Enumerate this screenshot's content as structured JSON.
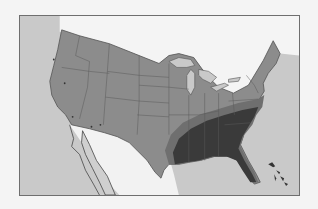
{
  "map": {
    "title": "",
    "region": "United States (contiguous)",
    "projection_style": "grayscale choropleth",
    "colors": {
      "page_background": "#f4f4f4",
      "ocean": "#c9c9c9",
      "foreign_land": "#f2f2f2",
      "us_land": "#8c8c8c",
      "transition_zone": "#6f6f6f",
      "core_range": "#3a3a3a",
      "lakes": "#c9c9c9",
      "borders": "#5a5a5a",
      "frame": "#6e6e6e"
    },
    "zones": [
      {
        "name": "core-range",
        "description": "Southeastern United States, dark shading",
        "level": "high"
      },
      {
        "name": "transition-band",
        "description": "Band bordering the core range from Texas to Virginia",
        "level": "medium"
      },
      {
        "name": "rest-of-us",
        "description": "Remaining contiguous US",
        "level": "low"
      }
    ],
    "features": [
      "Great Lakes",
      "Gulf of Mexico",
      "Atlantic Ocean",
      "Pacific Ocean",
      "Baja California",
      "Bahamas",
      "Florida"
    ]
  }
}
